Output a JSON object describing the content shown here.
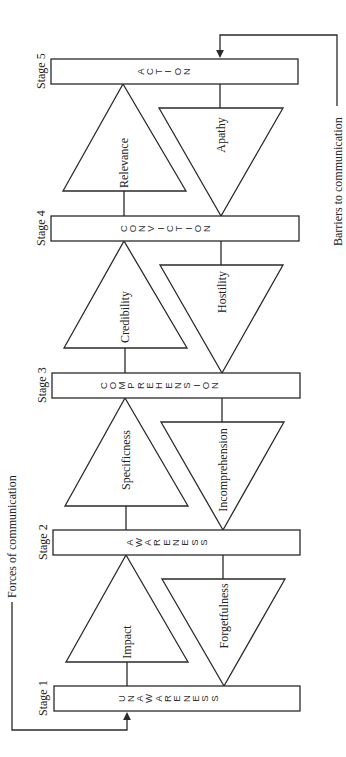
{
  "diagram": {
    "orientation": "rotated-90-ccw",
    "stages": [
      {
        "label": "Stage 1",
        "name": "UNAWARENESS",
        "letters": [
          "U",
          "N",
          "A",
          "W",
          "A",
          "R",
          "E",
          "N",
          "E",
          "S",
          "S"
        ]
      },
      {
        "label": "Stage 2",
        "name": "AWARENESS",
        "letters": [
          "A",
          "W",
          "A",
          "R",
          "E",
          "N",
          "E",
          "S",
          "S"
        ]
      },
      {
        "label": "Stage 3",
        "name": "COMPREHENSION",
        "letters": [
          "C",
          "O",
          "M",
          "P",
          "R",
          "E",
          "H",
          "E",
          "N",
          "S",
          "I",
          "O",
          "N"
        ]
      },
      {
        "label": "Stage 4",
        "name": "CONVICTION",
        "letters": [
          "C",
          "O",
          "N",
          "V",
          "I",
          "C",
          "T",
          "I",
          "O",
          "N"
        ]
      },
      {
        "label": "Stage 5",
        "name": "ACTION",
        "letters": [
          "A",
          "C",
          "T",
          "I",
          "O",
          "N"
        ]
      }
    ],
    "forces": [
      "Impact",
      "Specificness",
      "Credibility",
      "Relevance"
    ],
    "barriers": [
      "Forgetfulness",
      "Incomprehension",
      "Hostility",
      "Apathy"
    ],
    "forces_label": "Forces of communication",
    "barriers_label": "Barriers to communication",
    "colors": {
      "line": "#2a2a2a",
      "background": "#ffffff",
      "text": "#222222"
    }
  }
}
